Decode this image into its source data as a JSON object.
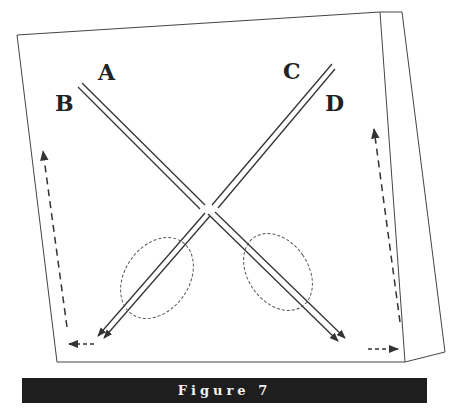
{
  "figure": {
    "caption": "Figure 7",
    "labels": {
      "a": "A",
      "b": "B",
      "c": "C",
      "d": "D"
    },
    "elements": [
      "tilted-panel",
      "crossing-double-line-A-B",
      "crossing-double-line-C-D",
      "dashed-ellipse-left",
      "dashed-ellipse-right",
      "dashed-arrow-left-up",
      "dashed-arrow-left-horizontal",
      "dashed-arrow-right-up",
      "dashed-arrow-right-horizontal"
    ],
    "colors": {
      "line": "#333333",
      "caption_bg": "#1e1e1e",
      "caption_text": "#f2f2f2"
    }
  }
}
